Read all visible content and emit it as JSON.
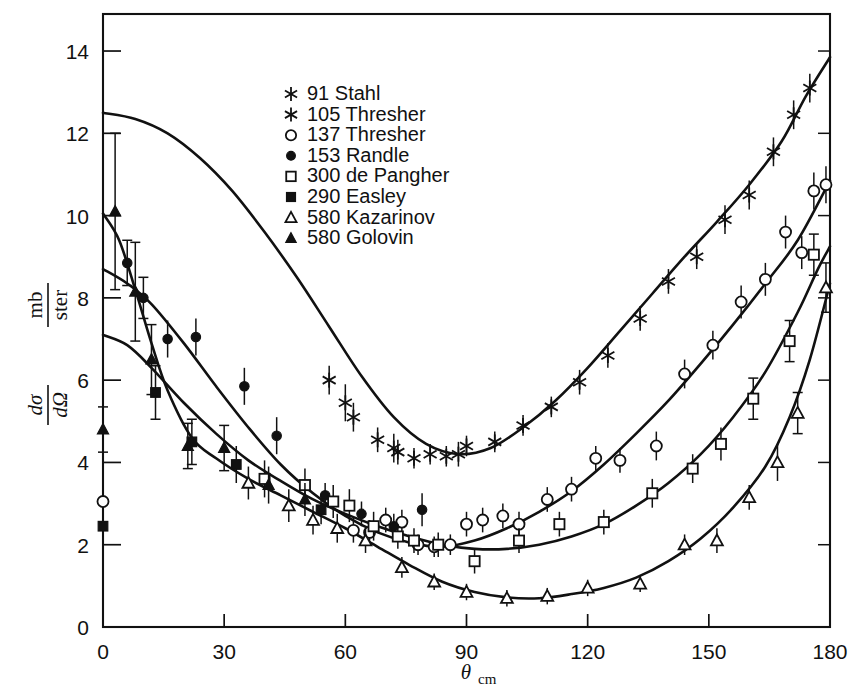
{
  "figure": {
    "title": "",
    "background_color": "#ffffff",
    "ink_color": "#111111"
  },
  "axes": {
    "x": {
      "label_main": "θ",
      "label_sub": "cm",
      "min": 0,
      "max": 180,
      "major_ticks": [
        0,
        30,
        60,
        90,
        120,
        150,
        180
      ],
      "tick_labels": [
        "0",
        "30",
        "60",
        "90",
        "120",
        "150",
        "180"
      ]
    },
    "y": {
      "label_numerator_main": "dσ",
      "label_denominator_main": "dΩ",
      "label_units_numerator": "mb",
      "label_units_denominator": "ster",
      "min": 0,
      "max": 14.9,
      "major_ticks": [
        0,
        2,
        4,
        6,
        8,
        10,
        12,
        14
      ],
      "tick_labels": [
        "0",
        "2",
        "4",
        "6",
        "8",
        "10",
        "12",
        "14"
      ]
    }
  },
  "legend": {
    "items": [
      {
        "marker": "star6",
        "energy": "91",
        "author": "Stahl",
        "label": "91 Stahl"
      },
      {
        "marker": "star6",
        "energy": "105",
        "author": "Thresher",
        "label": "105 Thresher"
      },
      {
        "marker": "circle-open",
        "energy": "137",
        "author": "Thresher",
        "label": "137 Thresher"
      },
      {
        "marker": "circle-filled",
        "energy": "153",
        "author": "Randle",
        "label": "153 Randle"
      },
      {
        "marker": "square-open",
        "energy": "300",
        "author": "de Pangher",
        "label": "300 de Pangher"
      },
      {
        "marker": "square-filled",
        "energy": "290",
        "author": "Easley",
        "label": "290 Easley"
      },
      {
        "marker": "triangle-open",
        "energy": "580",
        "author": "Kazarinov",
        "label": "580 Kazarinov"
      },
      {
        "marker": "triangle-filled",
        "energy": "580",
        "author": "Golovin",
        "label": "580 Golovin"
      }
    ]
  },
  "chart_data": {
    "type": "scatter",
    "title": "",
    "xlabel": "θcm",
    "ylabel": "dσ/dΩ (mb/ster)",
    "xlim": [
      0,
      180
    ],
    "ylim": [
      0,
      14.9
    ],
    "grid": false,
    "legend_position": "upper-left-inside",
    "series": [
      {
        "name": "91 Stahl",
        "marker": "star6",
        "points": [
          {
            "x": 56,
            "y": 6.0,
            "err": 0.35
          },
          {
            "x": 62,
            "y": 5.1,
            "err": 0.35
          },
          {
            "x": 68,
            "y": 4.55,
            "err": 0.3
          },
          {
            "x": 73,
            "y": 4.25,
            "err": 0.3
          },
          {
            "x": 77,
            "y": 4.1,
            "err": 0.25
          },
          {
            "x": 81,
            "y": 4.2,
            "err": 0.25
          },
          {
            "x": 85,
            "y": 4.15,
            "err": 0.25
          },
          {
            "x": 90,
            "y": 4.4,
            "err": 0.25
          },
          {
            "x": 97,
            "y": 4.5,
            "err": 0.25
          },
          {
            "x": 104,
            "y": 4.9,
            "err": 0.25
          },
          {
            "x": 111,
            "y": 5.35,
            "err": 0.25
          },
          {
            "x": 118,
            "y": 5.95,
            "err": 0.3
          },
          {
            "x": 125,
            "y": 6.6,
            "err": 0.3
          },
          {
            "x": 133,
            "y": 7.5,
            "err": 0.3
          },
          {
            "x": 140,
            "y": 8.4,
            "err": 0.3
          },
          {
            "x": 147,
            "y": 9.0,
            "err": 0.3
          },
          {
            "x": 154,
            "y": 9.9,
            "err": 0.35
          },
          {
            "x": 160,
            "y": 10.5,
            "err": 0.35
          },
          {
            "x": 166,
            "y": 11.55,
            "err": 0.35
          },
          {
            "x": 171,
            "y": 12.45,
            "err": 0.35
          },
          {
            "x": 175,
            "y": 13.1,
            "err": 0.35
          }
        ]
      },
      {
        "name": "105 Thresher",
        "marker": "star6",
        "points": [
          {
            "x": 60,
            "y": 5.45,
            "err": 0.45
          },
          {
            "x": 72,
            "y": 4.35,
            "err": 0.35
          },
          {
            "x": 88,
            "y": 4.2,
            "err": 0.3
          }
        ]
      },
      {
        "name": "137 Thresher",
        "marker": "circle-open",
        "points": [
          {
            "x": 0,
            "y": 3.05,
            "err": 0.4
          },
          {
            "x": 62,
            "y": 2.35,
            "err": 0.3
          },
          {
            "x": 66,
            "y": 2.3,
            "err": 0.3
          },
          {
            "x": 70,
            "y": 2.6,
            "err": 0.3
          },
          {
            "x": 74,
            "y": 2.55,
            "err": 0.3
          },
          {
            "x": 78,
            "y": 2.0,
            "err": 0.25
          },
          {
            "x": 82,
            "y": 1.95,
            "err": 0.25
          },
          {
            "x": 86,
            "y": 2.0,
            "err": 0.25
          },
          {
            "x": 90,
            "y": 2.5,
            "err": 0.3
          },
          {
            "x": 94,
            "y": 2.6,
            "err": 0.3
          },
          {
            "x": 99,
            "y": 2.7,
            "err": 0.3
          },
          {
            "x": 103,
            "y": 2.5,
            "err": 0.3
          },
          {
            "x": 110,
            "y": 3.1,
            "err": 0.3
          },
          {
            "x": 116,
            "y": 3.35,
            "err": 0.3
          },
          {
            "x": 122,
            "y": 4.1,
            "err": 0.3
          },
          {
            "x": 128,
            "y": 4.05,
            "err": 0.3
          },
          {
            "x": 137,
            "y": 4.4,
            "err": 0.35
          },
          {
            "x": 144,
            "y": 6.15,
            "err": 0.35
          },
          {
            "x": 151,
            "y": 6.85,
            "err": 0.35
          },
          {
            "x": 158,
            "y": 7.9,
            "err": 0.4
          },
          {
            "x": 164,
            "y": 8.45,
            "err": 0.4
          },
          {
            "x": 169,
            "y": 9.6,
            "err": 0.4
          },
          {
            "x": 173,
            "y": 9.1,
            "err": 0.4
          },
          {
            "x": 176,
            "y": 10.6,
            "err": 0.45
          },
          {
            "x": 179,
            "y": 10.75,
            "err": 0.45
          }
        ]
      },
      {
        "name": "153 Randle",
        "marker": "circle-filled",
        "points": [
          {
            "x": 6,
            "y": 8.85,
            "err": 0.55
          },
          {
            "x": 10,
            "y": 8.0,
            "err": 0.5
          },
          {
            "x": 16,
            "y": 7.0,
            "err": 0.45
          },
          {
            "x": 23,
            "y": 7.05,
            "err": 0.45
          },
          {
            "x": 35,
            "y": 5.85,
            "err": 0.45
          },
          {
            "x": 43,
            "y": 4.65,
            "err": 0.45
          },
          {
            "x": 55,
            "y": 3.2,
            "err": 0.3
          },
          {
            "x": 64,
            "y": 2.75,
            "err": 0.3
          },
          {
            "x": 72,
            "y": 2.45,
            "err": 0.3
          },
          {
            "x": 79,
            "y": 2.85,
            "err": 0.4
          }
        ]
      },
      {
        "name": "300 de Pangher",
        "marker": "square-open",
        "points": [
          {
            "x": 40,
            "y": 3.6,
            "err": 0.45
          },
          {
            "x": 50,
            "y": 3.45,
            "err": 0.4
          },
          {
            "x": 57,
            "y": 3.05,
            "err": 0.4
          },
          {
            "x": 61,
            "y": 2.95,
            "err": 0.4
          },
          {
            "x": 67,
            "y": 2.45,
            "err": 0.35
          },
          {
            "x": 73,
            "y": 2.2,
            "err": 0.3
          },
          {
            "x": 77,
            "y": 2.1,
            "err": 0.3
          },
          {
            "x": 83,
            "y": 2.0,
            "err": 0.3
          },
          {
            "x": 92,
            "y": 1.6,
            "err": 0.3
          },
          {
            "x": 103,
            "y": 2.1,
            "err": 0.3
          },
          {
            "x": 113,
            "y": 2.5,
            "err": 0.3
          },
          {
            "x": 124,
            "y": 2.55,
            "err": 0.3
          },
          {
            "x": 136,
            "y": 3.25,
            "err": 0.35
          },
          {
            "x": 146,
            "y": 3.85,
            "err": 0.35
          },
          {
            "x": 153,
            "y": 4.45,
            "err": 0.4
          },
          {
            "x": 161,
            "y": 5.55,
            "err": 0.5
          },
          {
            "x": 170,
            "y": 6.95,
            "err": 0.5
          },
          {
            "x": 176,
            "y": 9.05,
            "err": 0.5
          }
        ]
      },
      {
        "name": "290 Easley",
        "marker": "square-filled",
        "points": [
          {
            "x": 0,
            "y": 2.45,
            "err": 0.25
          },
          {
            "x": 13,
            "y": 5.7,
            "err": 0.65
          },
          {
            "x": 22,
            "y": 4.5,
            "err": 0.55
          },
          {
            "x": 33,
            "y": 3.95,
            "err": 0.45
          },
          {
            "x": 54,
            "y": 2.85,
            "err": 0.35
          }
        ]
      },
      {
        "name": "580 Kazarinov",
        "marker": "triangle-open",
        "points": [
          {
            "x": 36,
            "y": 3.5,
            "err": 0.4
          },
          {
            "x": 46,
            "y": 2.95,
            "err": 0.4
          },
          {
            "x": 52,
            "y": 2.6,
            "err": 0.35
          },
          {
            "x": 58,
            "y": 2.4,
            "err": 0.35
          },
          {
            "x": 65,
            "y": 2.1,
            "err": 0.3
          },
          {
            "x": 74,
            "y": 1.45,
            "err": 0.25
          },
          {
            "x": 82,
            "y": 1.1,
            "err": 0.2
          },
          {
            "x": 90,
            "y": 0.85,
            "err": 0.2
          },
          {
            "x": 100,
            "y": 0.7,
            "err": 0.2
          },
          {
            "x": 110,
            "y": 0.75,
            "err": 0.2
          },
          {
            "x": 120,
            "y": 0.95,
            "err": 0.2
          },
          {
            "x": 133,
            "y": 1.05,
            "err": 0.2
          },
          {
            "x": 144,
            "y": 2.0,
            "err": 0.25
          },
          {
            "x": 152,
            "y": 2.1,
            "err": 0.3
          },
          {
            "x": 160,
            "y": 3.15,
            "err": 0.3
          },
          {
            "x": 167,
            "y": 4.0,
            "err": 0.45
          },
          {
            "x": 172,
            "y": 5.2,
            "err": 0.5
          },
          {
            "x": 179,
            "y": 8.25,
            "err": 0.6
          }
        ]
      },
      {
        "name": "580 Golovin",
        "marker": "triangle-filled",
        "points": [
          {
            "x": 0,
            "y": 4.8,
            "err": 0.55
          },
          {
            "x": 3,
            "y": 10.1,
            "err": 1.9
          },
          {
            "x": 8,
            "y": 8.15,
            "err": 1.2
          },
          {
            "x": 12,
            "y": 6.5,
            "err": 0.85
          },
          {
            "x": 21,
            "y": 4.4,
            "err": 0.55
          },
          {
            "x": 30,
            "y": 4.35,
            "err": 0.55
          },
          {
            "x": 41,
            "y": 3.45,
            "err": 0.45
          },
          {
            "x": 50,
            "y": 3.1,
            "err": 0.4
          }
        ]
      }
    ],
    "curves": [
      {
        "name": "curve-91-stahl",
        "points": [
          [
            0,
            12.5
          ],
          [
            8,
            12.35
          ],
          [
            16,
            12.0
          ],
          [
            24,
            11.4
          ],
          [
            32,
            10.6
          ],
          [
            40,
            9.6
          ],
          [
            48,
            8.5
          ],
          [
            56,
            7.3
          ],
          [
            64,
            6.1
          ],
          [
            72,
            5.1
          ],
          [
            80,
            4.45
          ],
          [
            88,
            4.2
          ],
          [
            96,
            4.35
          ],
          [
            104,
            4.85
          ],
          [
            112,
            5.5
          ],
          [
            120,
            6.3
          ],
          [
            128,
            7.2
          ],
          [
            136,
            8.1
          ],
          [
            144,
            9.0
          ],
          [
            152,
            9.85
          ],
          [
            160,
            10.75
          ],
          [
            168,
            11.8
          ],
          [
            174,
            12.9
          ],
          [
            180,
            13.85
          ]
        ]
      },
      {
        "name": "curve-137-thresher",
        "points": [
          [
            0,
            8.7
          ],
          [
            6,
            8.35
          ],
          [
            12,
            7.85
          ],
          [
            20,
            6.9
          ],
          [
            28,
            5.85
          ],
          [
            36,
            4.85
          ],
          [
            44,
            3.95
          ],
          [
            52,
            3.25
          ],
          [
            60,
            2.7
          ],
          [
            68,
            2.3
          ],
          [
            76,
            2.05
          ],
          [
            84,
            1.95
          ],
          [
            92,
            2.1
          ],
          [
            100,
            2.4
          ],
          [
            108,
            2.8
          ],
          [
            116,
            3.3
          ],
          [
            124,
            3.95
          ],
          [
            132,
            4.7
          ],
          [
            140,
            5.5
          ],
          [
            148,
            6.4
          ],
          [
            156,
            7.35
          ],
          [
            164,
            8.35
          ],
          [
            172,
            9.4
          ],
          [
            180,
            10.85
          ]
        ]
      },
      {
        "name": "curve-290-300",
        "points": [
          [
            0,
            7.1
          ],
          [
            6,
            6.85
          ],
          [
            12,
            6.3
          ],
          [
            20,
            5.45
          ],
          [
            28,
            4.7
          ],
          [
            36,
            4.05
          ],
          [
            44,
            3.55
          ],
          [
            52,
            3.1
          ],
          [
            60,
            2.75
          ],
          [
            68,
            2.45
          ],
          [
            76,
            2.2
          ],
          [
            84,
            2.0
          ],
          [
            92,
            1.9
          ],
          [
            100,
            1.9
          ],
          [
            108,
            2.0
          ],
          [
            116,
            2.2
          ],
          [
            124,
            2.5
          ],
          [
            132,
            2.95
          ],
          [
            140,
            3.5
          ],
          [
            148,
            4.2
          ],
          [
            156,
            5.1
          ],
          [
            164,
            6.2
          ],
          [
            172,
            7.65
          ],
          [
            177,
            8.7
          ],
          [
            180,
            9.25
          ]
        ]
      },
      {
        "name": "curve-580",
        "points": [
          [
            0,
            10.05
          ],
          [
            4,
            9.4
          ],
          [
            8,
            8.2
          ],
          [
            12,
            6.9
          ],
          [
            16,
            5.75
          ],
          [
            22,
            4.6
          ],
          [
            28,
            4.1
          ],
          [
            36,
            3.6
          ],
          [
            44,
            3.2
          ],
          [
            52,
            2.8
          ],
          [
            60,
            2.4
          ],
          [
            68,
            1.95
          ],
          [
            76,
            1.5
          ],
          [
            84,
            1.1
          ],
          [
            92,
            0.85
          ],
          [
            100,
            0.72
          ],
          [
            108,
            0.7
          ],
          [
            116,
            0.8
          ],
          [
            124,
            0.95
          ],
          [
            132,
            1.2
          ],
          [
            140,
            1.6
          ],
          [
            148,
            2.15
          ],
          [
            156,
            2.9
          ],
          [
            164,
            3.9
          ],
          [
            170,
            5.1
          ],
          [
            175,
            6.5
          ],
          [
            180,
            8.35
          ]
        ]
      }
    ]
  }
}
